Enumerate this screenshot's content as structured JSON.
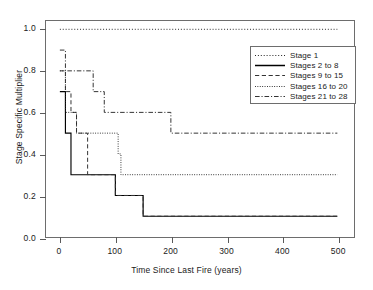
{
  "chart_data": {
    "type": "line",
    "subtype": "step",
    "title": "",
    "xlabel": "Time Since Last Fire (years)",
    "ylabel": "Stage Specific Multiplier",
    "xlim": [
      -25,
      530
    ],
    "ylim": [
      0.0,
      1.04
    ],
    "xticks": [
      0,
      100,
      200,
      300,
      400,
      500
    ],
    "xtick_labels": [
      "0",
      "100",
      "200",
      "300",
      "400",
      "500"
    ],
    "yticks": [
      0.0,
      0.2,
      0.4,
      0.6,
      0.8,
      1.0
    ],
    "ytick_labels": [
      "0.0",
      "0.2",
      "0.4",
      "0.6",
      "0.8",
      "1.0"
    ],
    "grid": false,
    "legend_position": "top-right",
    "series": [
      {
        "name": "Stage 1",
        "linestyle": "dotted",
        "color": "#262626",
        "x": [
          0,
          500
        ],
        "y": [
          1.0,
          1.0
        ]
      },
      {
        "name": "Stages 2 to 8",
        "linestyle": "solid",
        "color": "#000000",
        "x": [
          0,
          10,
          20,
          100,
          150,
          500
        ],
        "y": [
          0.7,
          0.5,
          0.3,
          0.2,
          0.1,
          0.1
        ]
      },
      {
        "name": "Stages 9 to 15",
        "linestyle": "dashed",
        "color": "#333333",
        "x": [
          0,
          10,
          20,
          30,
          50,
          100,
          150,
          500
        ],
        "y": [
          0.8,
          0.7,
          0.6,
          0.5,
          0.3,
          0.2,
          0.1,
          0.1
        ]
      },
      {
        "name": "Stages 16 to 20",
        "linestyle": "fine-dotted",
        "color": "#262626",
        "x": [
          0,
          10,
          30,
          105,
          110,
          500
        ],
        "y": [
          0.8,
          0.6,
          0.5,
          0.4,
          0.3,
          0.3
        ]
      },
      {
        "name": "Stages 21 to 28",
        "linestyle": "dash-dot",
        "color": "#333333",
        "x": [
          0,
          10,
          60,
          80,
          200,
          500
        ],
        "y": [
          0.9,
          0.8,
          0.7,
          0.6,
          0.5,
          0.5
        ]
      }
    ]
  },
  "axes": {
    "x_title": "Time Since Last Fire (years)",
    "y_title": "Stage Specific Multiplier",
    "x_labels": [
      "0",
      "100",
      "200",
      "300",
      "400",
      "500"
    ],
    "y_labels": [
      "0.0",
      "0.2",
      "0.4",
      "0.6",
      "0.8",
      "1.0"
    ]
  },
  "legend": {
    "entries": [
      {
        "label": "Stage 1"
      },
      {
        "label": "Stages 2 to 8"
      },
      {
        "label": "Stages 9 to 15"
      },
      {
        "label": "Stages 16 to 20"
      },
      {
        "label": "Stages 21 to 28"
      }
    ]
  }
}
